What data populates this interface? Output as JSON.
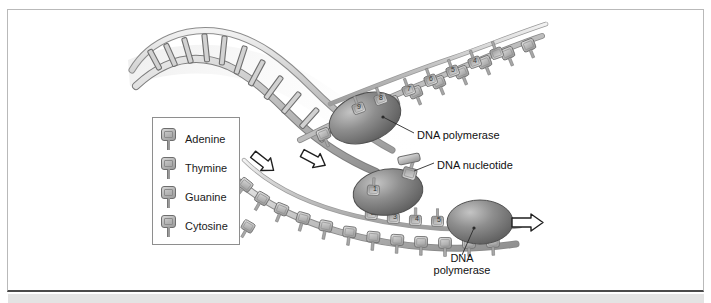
{
  "figure": {
    "background_color": "#ffffff",
    "frame_border_color": "#b9b9b9",
    "frame_bottom_rule_color": "#4a4a4a",
    "bottom_strip_color": "#e3e3e3"
  },
  "legend": {
    "name": "nucleotide-key",
    "border_color": "#8e8e8e",
    "items": [
      {
        "label": "Adenine",
        "swatch": "nucleotide-icon",
        "color": "#b3b3b3"
      },
      {
        "label": "Thymine",
        "swatch": "nucleotide-icon",
        "color": "#bdbdbd"
      },
      {
        "label": "Guanine",
        "swatch": "nucleotide-icon",
        "color": "#aaaaaa"
      },
      {
        "label": "Cytosine",
        "swatch": "nucleotide-icon",
        "color": "#b8b8b8"
      }
    ]
  },
  "callouts": {
    "polymerase_top": "DNA polymerase",
    "nucleotide": "DNA nucleotide",
    "polymerase_bottom_line1": "DNA",
    "polymerase_bottom_line2": "polymerase"
  },
  "diagram": {
    "parent_helix": "double-helix-unwinding",
    "leading_strand": "daughter-strand-top",
    "lagging_strand": "daughter-strand-bottom",
    "enzymes": [
      {
        "name": "dna-polymerase-top",
        "shape": "ovoid"
      },
      {
        "name": "dna-polymerase-middle",
        "shape": "ovoid"
      },
      {
        "name": "dna-polymerase-bottom",
        "shape": "ovoid"
      }
    ],
    "arrows": [
      {
        "name": "direction-arrow-top",
        "direction": "down-right"
      },
      {
        "name": "direction-arrow-middle",
        "direction": "down-right"
      },
      {
        "name": "direction-arrow-right",
        "direction": "right"
      }
    ],
    "base_numbers": [
      "1",
      "2",
      "3",
      "4",
      "5",
      "6",
      "7",
      "8",
      "9"
    ]
  }
}
